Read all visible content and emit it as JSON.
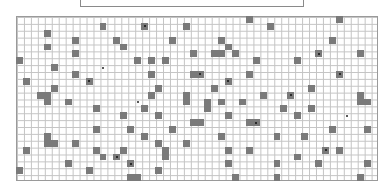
{
  "game": {
    "title_box": "",
    "grid": {
      "cols": 52,
      "rows": 24,
      "cell_w": 6.96,
      "cell_h": 6.88,
      "line_color": "#c4c4c4",
      "fill_color": "#7a7a7a",
      "dot_color": "#111111"
    },
    "filled_cells": [
      [
        12,
        1
      ],
      [
        4,
        2
      ],
      [
        8,
        3
      ],
      [
        4,
        4
      ],
      [
        8,
        5
      ],
      [
        0,
        6
      ],
      [
        5,
        7
      ],
      [
        8,
        8
      ],
      [
        1,
        9
      ],
      [
        5,
        10
      ],
      [
        3,
        11
      ],
      [
        4,
        11
      ],
      [
        24,
        1
      ],
      [
        14,
        3
      ],
      [
        15,
        4
      ],
      [
        22,
        3
      ],
      [
        17,
        6
      ],
      [
        19,
        6
      ],
      [
        21,
        6
      ],
      [
        19,
        8
      ],
      [
        25,
        8
      ],
      [
        20,
        10
      ],
      [
        19,
        11
      ],
      [
        24,
        11
      ],
      [
        33,
        0
      ],
      [
        36,
        1
      ],
      [
        29,
        3
      ],
      [
        30,
        4
      ],
      [
        25,
        5
      ],
      [
        28,
        5
      ],
      [
        29,
        5
      ],
      [
        31,
        5
      ],
      [
        34,
        6
      ],
      [
        33,
        8
      ],
      [
        28,
        10
      ],
      [
        35,
        11
      ],
      [
        46,
        0
      ],
      [
        45,
        3
      ],
      [
        49,
        5
      ],
      [
        40,
        6
      ],
      [
        42,
        10
      ],
      [
        49,
        11
      ],
      [
        49,
        12
      ],
      [
        50,
        12
      ],
      [
        4,
        12
      ],
      [
        7,
        12
      ],
      [
        11,
        13
      ],
      [
        11,
        16
      ],
      [
        4,
        17
      ],
      [
        4,
        18
      ],
      [
        5,
        18
      ],
      [
        8,
        18
      ],
      [
        1,
        19
      ],
      [
        11,
        19
      ],
      [
        12,
        20
      ],
      [
        7,
        21
      ],
      [
        0,
        22
      ],
      [
        10,
        22
      ],
      [
        24,
        12
      ],
      [
        18,
        13
      ],
      [
        15,
        14
      ],
      [
        20,
        14
      ],
      [
        25,
        15
      ],
      [
        16,
        16
      ],
      [
        22,
        16
      ],
      [
        18,
        17
      ],
      [
        20,
        18
      ],
      [
        24,
        18
      ],
      [
        21,
        19
      ],
      [
        21,
        20
      ],
      [
        15,
        19
      ],
      [
        20,
        22
      ],
      [
        16,
        23
      ],
      [
        17,
        23
      ],
      [
        27,
        12
      ],
      [
        27,
        13
      ],
      [
        29,
        12
      ],
      [
        32,
        12
      ],
      [
        38,
        13
      ],
      [
        30,
        14
      ],
      [
        26,
        15
      ],
      [
        33,
        15
      ],
      [
        29,
        17
      ],
      [
        37,
        17
      ],
      [
        30,
        19
      ],
      [
        33,
        19
      ],
      [
        30,
        21
      ],
      [
        37,
        21
      ],
      [
        31,
        23
      ],
      [
        37,
        23
      ],
      [
        42,
        13
      ],
      [
        40,
        14
      ],
      [
        45,
        16
      ],
      [
        50,
        16
      ],
      [
        41,
        17
      ],
      [
        46,
        19
      ],
      [
        40,
        20
      ],
      [
        43,
        21
      ],
      [
        50,
        21
      ],
      [
        49,
        23
      ]
    ],
    "dotted_cells": [
      [
        10,
        9
      ],
      [
        18,
        1
      ],
      [
        26,
        8
      ],
      [
        30,
        9
      ],
      [
        43,
        5
      ],
      [
        46,
        8
      ],
      [
        39,
        11
      ],
      [
        34,
        15
      ],
      [
        14,
        20
      ],
      [
        16,
        21
      ],
      [
        44,
        19
      ]
    ],
    "markers": [
      [
        12,
        7
      ],
      [
        17,
        12
      ],
      [
        47,
        14
      ]
    ]
  }
}
